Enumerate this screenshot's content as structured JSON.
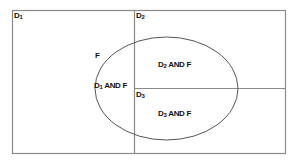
{
  "diagram": {
    "type": "set-partition-venn",
    "colors": {
      "line": "#8a8a8a",
      "ellipse": "#555555",
      "text": "#111111",
      "background": "#ffffff"
    },
    "regions": [
      {
        "id": "D1",
        "base": "D",
        "sub": "1"
      },
      {
        "id": "D2",
        "base": "D",
        "sub": "2"
      },
      {
        "id": "D3",
        "base": "D",
        "sub": "3"
      }
    ],
    "ellipse": {
      "id": "F",
      "label": "F"
    },
    "intersections": [
      {
        "base": "D",
        "sub": "2",
        "rest": " AND F"
      },
      {
        "base": "D",
        "sub": "1",
        "rest": " AND F"
      },
      {
        "base": "D",
        "sub": "3",
        "rest": " AND F"
      }
    ]
  }
}
